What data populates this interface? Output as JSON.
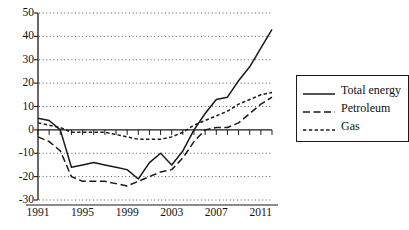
{
  "chart_data": {
    "type": "line",
    "title": "",
    "xlabel": "",
    "ylabel": "",
    "xlim": [
      1991,
      2012
    ],
    "ylim": [
      -30,
      50
    ],
    "ytick_values": [
      50,
      40,
      30,
      20,
      10,
      0,
      -10,
      -20,
      -30
    ],
    "ytick_labels": [
      "50",
      "40",
      "30",
      "20",
      "10",
      "0",
      "-10",
      "-20",
      "-30"
    ],
    "xtick_values": [
      1991,
      1995,
      1999,
      2003,
      2007,
      2011
    ],
    "xtick_labels": [
      "1991",
      "1995",
      "1999",
      "2003",
      "2007",
      "2011"
    ],
    "x": [
      1991,
      1992,
      1993,
      1994,
      1995,
      1996,
      1997,
      1998,
      1999,
      2000,
      2001,
      2002,
      2003,
      2004,
      2005,
      2006,
      2007,
      2008,
      2009,
      2010,
      2011,
      2012
    ],
    "grid": "horizontal-dotted",
    "zero_line": true,
    "legend_position": "right",
    "series": [
      {
        "name": "Total energy",
        "style": "solid",
        "color": "#1a1a1a",
        "values": [
          5,
          4,
          0,
          -16,
          -15,
          -14,
          -15,
          -16,
          -17,
          -21,
          -14,
          -10,
          -15,
          -9,
          0,
          7,
          13,
          14,
          21,
          27,
          35,
          43
        ]
      },
      {
        "name": "Petroleum",
        "style": "long-dash",
        "color": "#1a1a1a",
        "values": [
          -3,
          -5,
          -9,
          -20,
          -22,
          -22,
          -22,
          -23,
          -24,
          -22,
          -20,
          -18,
          -17,
          -12,
          -5,
          0,
          1,
          1,
          3,
          7,
          11,
          14
        ]
      },
      {
        "name": "Gas",
        "style": "short-dash",
        "color": "#1a1a1a",
        "values": [
          3,
          2,
          1,
          -1,
          -1,
          -1,
          -1,
          -2,
          -3,
          -4,
          -4,
          -4,
          -3,
          -1,
          2,
          4,
          6,
          8,
          11,
          13,
          15,
          16
        ]
      }
    ]
  },
  "legend": {
    "items": [
      {
        "label": "Total energy",
        "style": "solid"
      },
      {
        "label": "Petroleum",
        "style": "long-dash"
      },
      {
        "label": "Gas",
        "style": "short-dash"
      }
    ]
  }
}
